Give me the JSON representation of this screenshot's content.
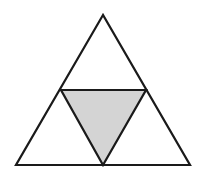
{
  "diagram": {
    "outer_triangle": {
      "points": "103,15 16,165 190,165"
    },
    "inner_triangle": {
      "points": "61,90 146,90 103,165",
      "fill": "#d4d4d4"
    },
    "stroke_color": "#1a1a1a",
    "background": "#ffffff"
  }
}
